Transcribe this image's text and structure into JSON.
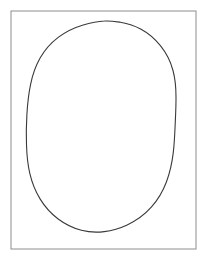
{
  "figure": {
    "caption": "",
    "canvas": {
      "width": 207,
      "height": 264,
      "background_color": "#ffffff"
    },
    "frame": {
      "name": "border-rectangle",
      "x": 11,
      "y": 11,
      "width": 185,
      "height": 238,
      "stroke_color": "#8e8e8e",
      "stroke_width": 1,
      "fill": "none"
    },
    "shape": {
      "name": "ellipse",
      "type": "ellipse",
      "center_x": 104.5,
      "center_y": 127,
      "radius_x": 71.5,
      "radius_y": 106,
      "bounds": {
        "left": 33,
        "right": 176,
        "top": 21,
        "bottom": 233
      },
      "stroke_color": "#3a3a3a",
      "stroke_width": 1.1,
      "fill": "none",
      "style": "hand-drawn",
      "path": "M 104.5 21.0 C 109.9 20.6 115.2 21.5 120.4 22.3 C 127.4 23.6 134.3 25.6 140.6 29.0 C 148.3 33.1 155.0 38.9 160.4 45.7 C 166.3 53.0 170.6 61.5 173.0 70.5 C 175.3 79.1 176.0 88.1 176.0 97.0 C 176.1 106.0 175.6 115.0 175.2 124.0 C 174.8 133.5 174.4 143.0 173.3 152.4 C 172.1 162.5 170.0 172.5 166.4 182.0 C 162.9 191.2 157.9 199.9 151.3 207.2 C 144.6 214.7 136.3 220.7 127.2 224.9 C 119.9 228.3 112.1 230.6 104.2 231.6 C 96.6 232.6 88.8 232.2 81.4 230.3 C 73.0 228.1 65.1 224.2 58.2 219.0 C 51.0 213.6 44.9 206.8 40.2 199.1 C 35.3 191.2 31.9 182.4 29.8 173.4 C 27.6 164.0 26.8 154.3 26.5 144.7 C 26.1 134.6 26.3 124.5 26.9 114.4 C 27.5 104.3 28.5 94.2 30.6 84.3 C 32.5 75.2 35.5 66.2 40.1 58.1 C 44.6 50.1 50.8 43.0 58.2 37.4 C 65.4 31.9 73.7 27.8 82.4 25.2 C 89.5 23.1 97.0 21.3 104.5 21.0 Z"
    }
  }
}
